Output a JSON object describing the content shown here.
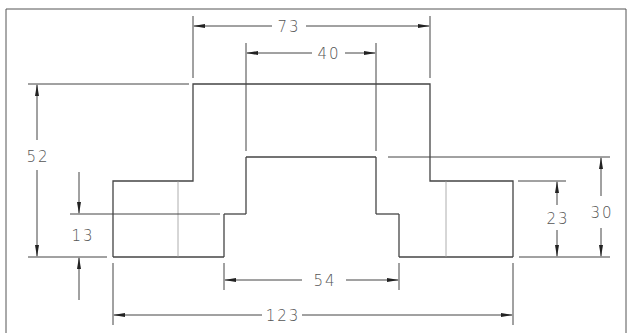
{
  "drawing": {
    "type": "technical-drawing",
    "view": "front elevation",
    "line_color": "#444444",
    "dimensions": {
      "top_width": "73",
      "inner_top_width": "40",
      "total_height": "52",
      "step_height_left": "13",
      "base_inner_width": "54",
      "overall_width": "123",
      "right_step_height": "23",
      "right_height": "30"
    }
  }
}
